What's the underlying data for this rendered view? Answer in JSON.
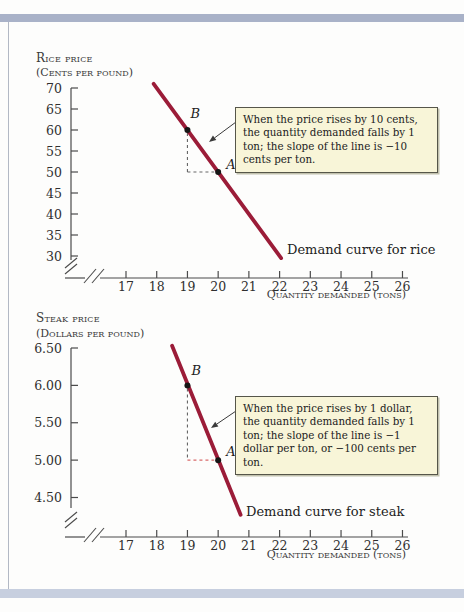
{
  "chart_data": [
    {
      "type": "line",
      "ylabel_line1": "Rice price",
      "ylabel_line2": "(Cents per pound)",
      "xlabel": "Quantity demanded (tons)",
      "x_ticks": [
        17,
        18,
        19,
        20,
        21,
        22,
        23,
        24,
        25,
        26
      ],
      "y_ticks": [
        {
          "v": 70,
          "label": "70"
        },
        {
          "v": 65,
          "label": "65"
        },
        {
          "v": 60,
          "label": "60"
        },
        {
          "v": 55,
          "label": "55"
        },
        {
          "v": 50,
          "label": "50"
        },
        {
          "v": 45,
          "label": "45"
        },
        {
          "v": 40,
          "label": "40"
        },
        {
          "v": 35,
          "label": "35"
        },
        {
          "v": 30,
          "label": "30"
        }
      ],
      "xlim": [
        17,
        26
      ],
      "ylim": [
        30,
        70
      ],
      "axis_breaks": true,
      "series": [
        {
          "name": "Demand curve for rice",
          "from": {
            "x": 17.9,
            "y": 71
          },
          "to": {
            "x": 22.05,
            "y": 29.5
          },
          "slope": -10,
          "slope_units": "cents per ton"
        }
      ],
      "points": [
        {
          "label": "B",
          "x": 19,
          "y": 60
        },
        {
          "label": "A",
          "x": 20,
          "y": 50
        }
      ],
      "annotation": "When the price rises by 10 cents, the quantity demanded falls by 1 ton; the slope of the line is −10 cents per ton.",
      "colors": {
        "curve": "#9b1c38",
        "dash_vertical": "#666666",
        "dash_horizontal": "#666666",
        "annotation_bg": "#f8f5d8"
      }
    },
    {
      "type": "line",
      "ylabel_line1": "Steak price",
      "ylabel_line2": "(Dollars per pound)",
      "xlabel": "Quantity demanded (tons)",
      "x_ticks": [
        17,
        18,
        19,
        20,
        21,
        22,
        23,
        24,
        25,
        26
      ],
      "y_ticks": [
        {
          "v": 6.5,
          "label": "6.50"
        },
        {
          "v": 6.0,
          "label": "6.00"
        },
        {
          "v": 5.5,
          "label": "5.50"
        },
        {
          "v": 5.0,
          "label": "5.00"
        },
        {
          "v": 4.5,
          "label": "4.50"
        }
      ],
      "xlim": [
        17,
        26
      ],
      "ylim": [
        4.5,
        6.5
      ],
      "axis_breaks": true,
      "series": [
        {
          "name": "Demand curve for steak",
          "from": {
            "x": 18.5,
            "y": 6.53
          },
          "to": {
            "x": 20.73,
            "y": 4.27
          },
          "slope": -1,
          "slope_units": "dollar per ton (−100 cents per ton)"
        }
      ],
      "points": [
        {
          "label": "B",
          "x": 19,
          "y": 6.0
        },
        {
          "label": "A",
          "x": 20,
          "y": 5.0
        }
      ],
      "annotation": "When the price rises by 1 dollar, the quantity demanded falls by 1 ton; the slope of the line is −1 dollar per ton, or −100 cents per ton.",
      "colors": {
        "curve": "#9b1c38",
        "dash_vertical": "#666666",
        "dash_horizontal": "#d96b6b",
        "annotation_bg": "#f8f5d8"
      }
    }
  ]
}
